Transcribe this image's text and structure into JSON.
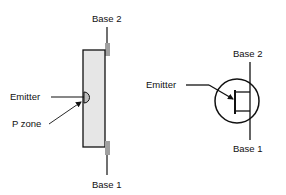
{
  "left_figure": {
    "title": "UJT physical structure",
    "labels": {
      "base2": "Base 2",
      "base1": "Base 1",
      "emitter": "Emitter",
      "pzone": "P zone"
    }
  },
  "right_figure": {
    "title": "UJT schematic symbol",
    "labels": {
      "base2": "Base 2",
      "base1": "Base 1",
      "emitter": "Emitter"
    }
  },
  "colors": {
    "body_fill": "#e6e6e6",
    "tab_fill": "#a0a0a0",
    "stroke": "#111111"
  }
}
